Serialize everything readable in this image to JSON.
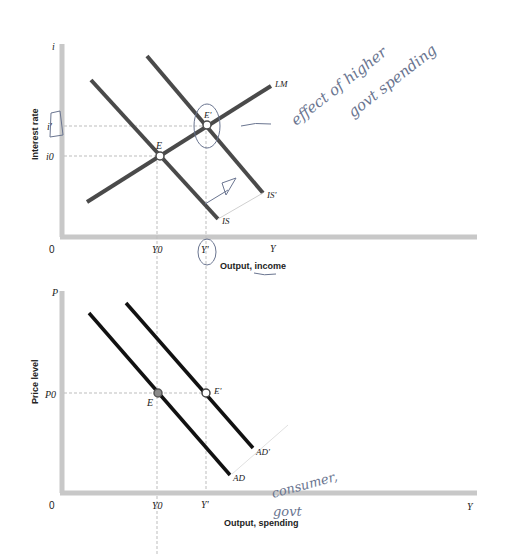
{
  "top_panel": {
    "y_axis_symbol": "i",
    "y_axis_label": "Interest rate",
    "x_axis_symbol": "Y",
    "x_axis_label": "Output, income",
    "origin": "0",
    "tick_y": [
      "i'",
      "i0"
    ],
    "tick_x": [
      "Y0",
      "Y'"
    ],
    "curves": [
      "LM",
      "IS",
      "IS'"
    ],
    "points": [
      "E",
      "E'"
    ]
  },
  "bottom_panel": {
    "y_axis_symbol": "P",
    "y_axis_label": "Price level",
    "x_axis_symbol": "Y",
    "x_axis_label": "Output, spending",
    "origin": "0",
    "tick_y": [
      "P0"
    ],
    "tick_x": [
      "Y0",
      "Y'"
    ],
    "curves": [
      "AD",
      "AD'"
    ],
    "points": [
      "E",
      "E'"
    ]
  },
  "annotations": {
    "note1_line1": "effect of higher",
    "note1_line2": "govt spending",
    "note2_line1": "consumer,",
    "note2_line2": "govt"
  },
  "colors": {
    "axis": "#c8c8c8",
    "curve_top": "#4a4a4a",
    "curve_bottom": "#111111",
    "guide": "#bdbdbd",
    "handwriting": "#6a7590"
  }
}
